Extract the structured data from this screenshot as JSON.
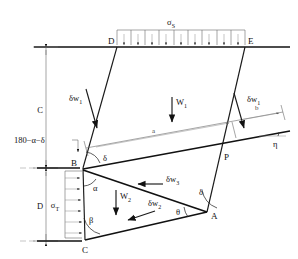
{
  "figure": {
    "points": {
      "A": "A",
      "B": "B",
      "C": "C",
      "D": "D",
      "E": "E",
      "P": "P"
    },
    "loads": {
      "surcharge_label": "σ",
      "surcharge_sub": "S",
      "lateral_label": "σ",
      "lateral_sub": "T"
    },
    "dimensions": {
      "height_upper": "C",
      "height_lower": "D",
      "length_a": "a",
      "length_b": "b"
    },
    "velocities": {
      "dw1_left": "δw",
      "dw1_left_sub": "1",
      "dw1_right": "δw",
      "dw1_right_sub": "1",
      "dw2": "δw",
      "dw2_sub": "2",
      "dw3": "δw",
      "dw3_sub": "3"
    },
    "weights": {
      "w1": "W",
      "w1_sub": "1",
      "w2": "W",
      "w2_sub": "2"
    },
    "angles": {
      "alpha": "α",
      "beta": "β",
      "delta_at_B": "δ",
      "delta_at_A": "δ",
      "theta": "θ",
      "eta": "η",
      "supplement": "180−α−δ"
    },
    "colors": {
      "line": "#111111",
      "thin_line": "#6a6a6a",
      "background": "#ffffff"
    }
  }
}
